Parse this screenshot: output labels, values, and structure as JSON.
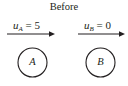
{
  "diagram": {
    "title": "Before",
    "bodies": [
      {
        "id": "A",
        "label": "A",
        "velocity_symbol": "u",
        "velocity_subscript": "A",
        "equals": "=",
        "velocity_value": "5"
      },
      {
        "id": "B",
        "label": "B",
        "velocity_symbol": "u",
        "velocity_subscript": "B",
        "equals": "=",
        "velocity_value": "0"
      }
    ],
    "colors": {
      "stroke": "#231f20",
      "background": "#ffffff"
    }
  }
}
